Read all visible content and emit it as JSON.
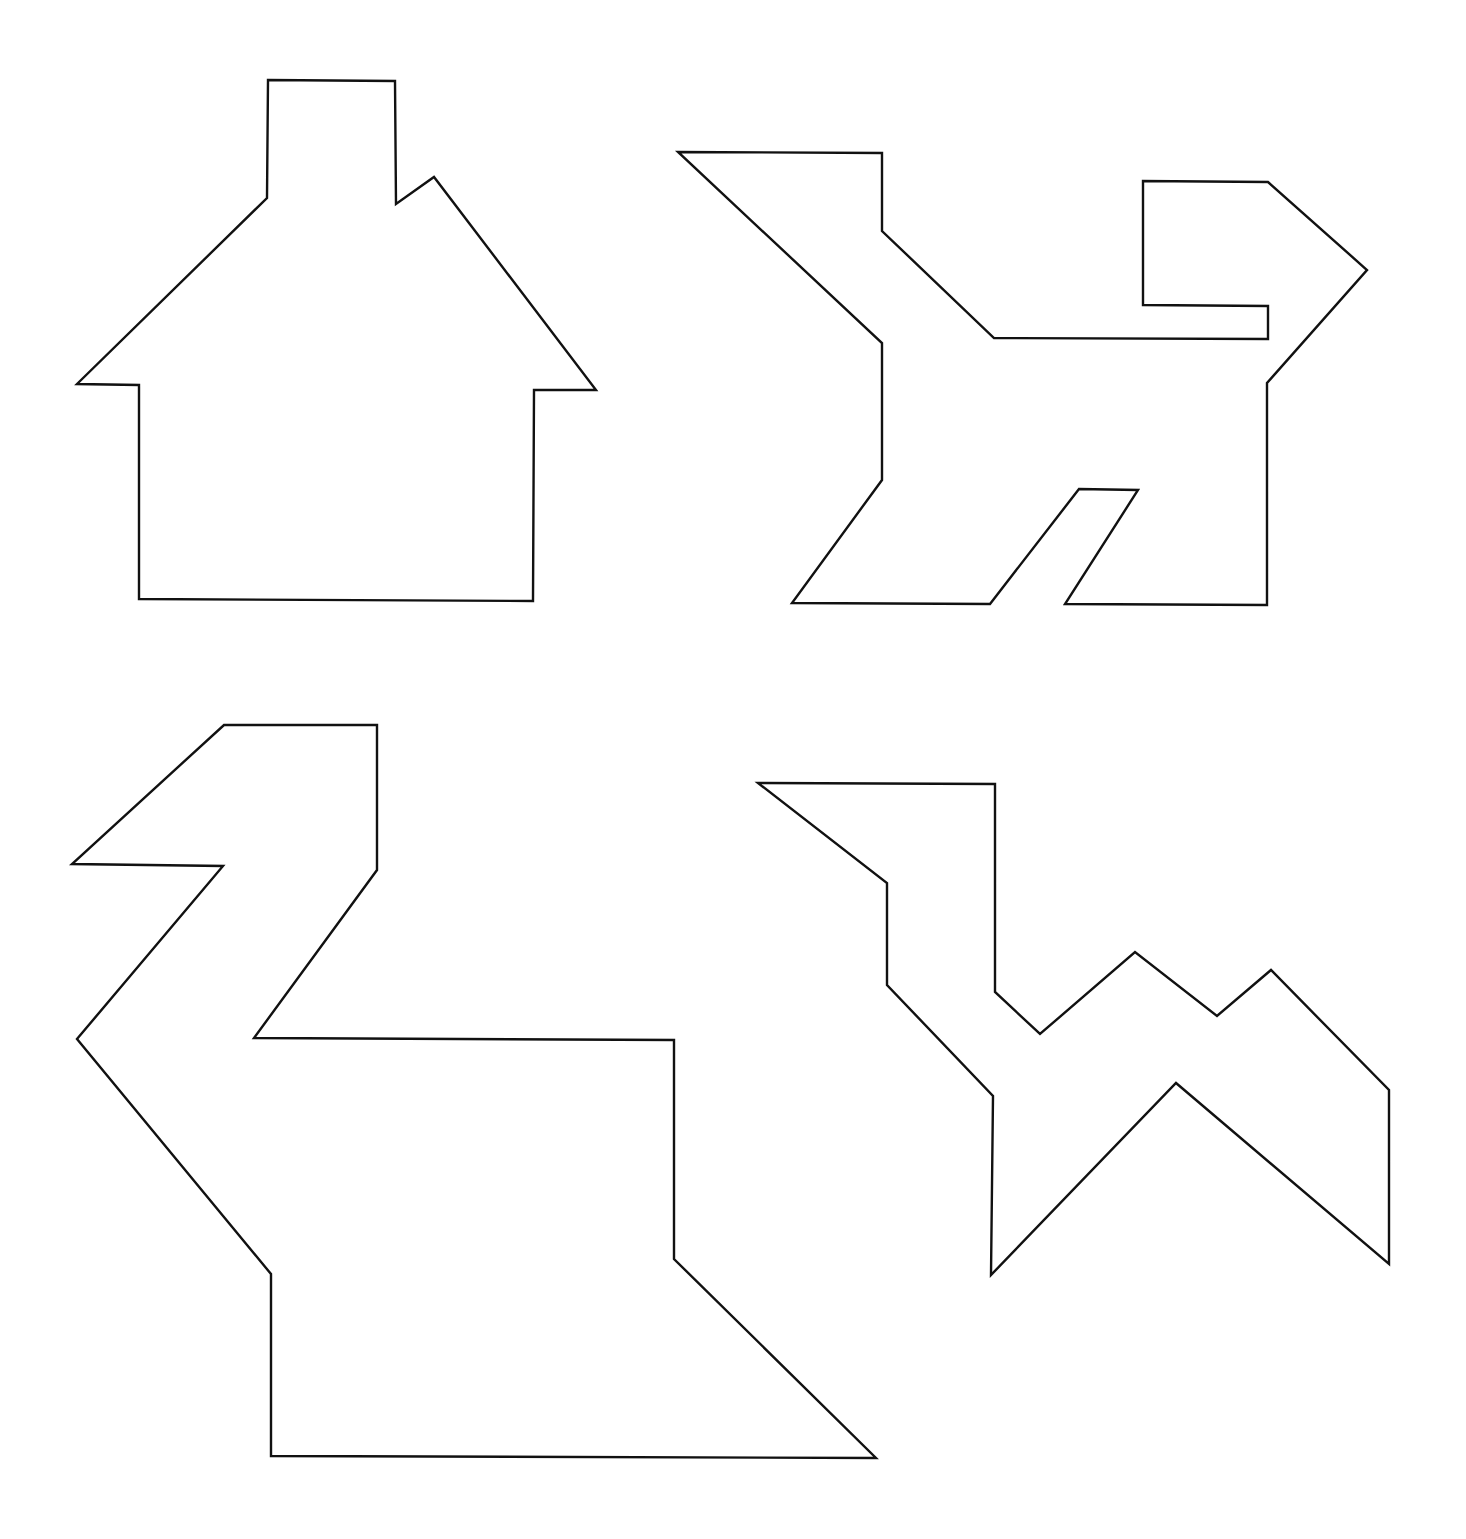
{
  "sheet": {
    "width": 1466,
    "height": 1539,
    "background": "#ffffff",
    "stroke_color": "#111111",
    "stroke_width": 2.4
  },
  "figures": [
    {
      "name": "house",
      "points": [
        [
          268,
          80
        ],
        [
          395,
          81
        ],
        [
          396,
          204
        ],
        [
          434,
          177
        ],
        [
          596,
          390
        ],
        [
          534,
          390
        ],
        [
          533,
          601
        ],
        [
          139,
          599
        ],
        [
          139,
          385
        ],
        [
          77,
          384
        ],
        [
          267,
          198
        ]
      ]
    },
    {
      "name": "dog",
      "points": [
        [
          678,
          152
        ],
        [
          882,
          153
        ],
        [
          882,
          231
        ],
        [
          994,
          338
        ],
        [
          1268,
          339
        ],
        [
          1268,
          306
        ],
        [
          1143,
          305
        ],
        [
          1143,
          181
        ],
        [
          1268,
          182
        ],
        [
          1367,
          270
        ],
        [
          1267,
          383
        ],
        [
          1267,
          605
        ],
        [
          1065,
          604
        ],
        [
          1138,
          490
        ],
        [
          1079,
          489
        ],
        [
          990,
          604
        ],
        [
          792,
          603
        ],
        [
          882,
          480
        ],
        [
          882,
          343
        ]
      ]
    },
    {
      "name": "swan",
      "points": [
        [
          224,
          725
        ],
        [
          377,
          725
        ],
        [
          377,
          870
        ],
        [
          254,
          1038
        ],
        [
          674,
          1040
        ],
        [
          674,
          1259
        ],
        [
          876,
          1458
        ],
        [
          271,
          1456
        ],
        [
          271,
          1274
        ],
        [
          77,
          1039
        ],
        [
          223,
          866
        ],
        [
          72,
          864
        ]
      ]
    },
    {
      "name": "camel",
      "points": [
        [
          758,
          783
        ],
        [
          995,
          784
        ],
        [
          995,
          992
        ],
        [
          1040,
          1034
        ],
        [
          1135,
          952
        ],
        [
          1217,
          1016
        ],
        [
          1271,
          970
        ],
        [
          1389,
          1090
        ],
        [
          1389,
          1264
        ],
        [
          1176,
          1083
        ],
        [
          991,
          1275
        ],
        [
          993,
          1096
        ],
        [
          887,
          985
        ],
        [
          887,
          883
        ]
      ]
    }
  ]
}
